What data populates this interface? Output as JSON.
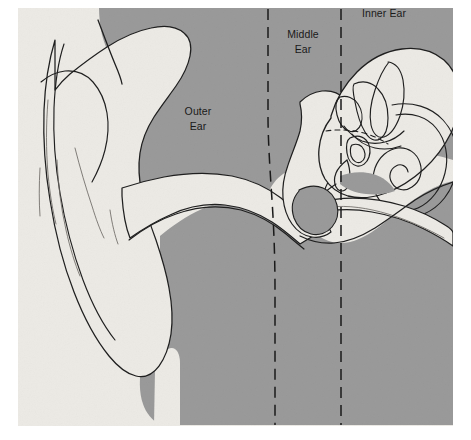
{
  "figure": {
    "kind": "anatomical-diagram",
    "page_background": "#ffffff",
    "canvas": {
      "x": 18,
      "y": 8,
      "width": 435,
      "height": 418,
      "paper_color": "#eceae5"
    },
    "colors": {
      "head_tissue": "#9a9a9a",
      "ear_structure": "#edeae5",
      "outline": "#1f1f1f",
      "faint_outline": "#6e6a66",
      "divider": "#1a1a1a",
      "label_text": "#1a1a1a"
    }
  },
  "labels": [
    {
      "id": "outer-ear",
      "line1": "Outer",
      "line2": "Ear",
      "x": 198,
      "y": 112
    },
    {
      "id": "middle-ear",
      "line1": "Middle",
      "line2": "Ear",
      "x": 303,
      "y": 35
    },
    {
      "id": "inner-ear",
      "line1": "Inner Ear",
      "line2": "",
      "x": 384,
      "y": 14
    }
  ],
  "dividers": [
    {
      "id": "outer-middle-divider",
      "x_top": 268,
      "y_top": 9,
      "x_bottom": 272,
      "y_bottom": 425,
      "style": "dashed",
      "description": "boundary between outer ear and middle ear"
    },
    {
      "id": "middle-inner-divider",
      "x_top": 341,
      "y_top": 9,
      "x_bottom": 341,
      "y_bottom": 425,
      "style": "dashed",
      "description": "boundary between middle ear and inner ear"
    }
  ],
  "structures": [
    {
      "id": "pinna",
      "name": "Pinna (auricle)"
    },
    {
      "id": "ear-canal",
      "name": "External auditory canal"
    },
    {
      "id": "eardrum",
      "name": "Tympanic membrane"
    },
    {
      "id": "ossicles",
      "name": "Ossicles (malleus, incus, stapes)"
    },
    {
      "id": "semicircular-canals",
      "name": "Semicircular canals"
    },
    {
      "id": "cochlea",
      "name": "Cochlea"
    },
    {
      "id": "eustachian-tube",
      "name": "Eustachian tube"
    }
  ]
}
